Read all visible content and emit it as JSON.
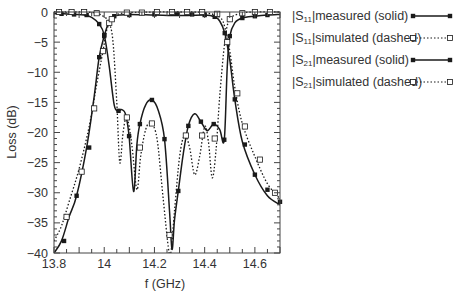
{
  "chart_data": {
    "type": "line",
    "title": "",
    "xlabel": "f (GHz)",
    "ylabel": "Loss (dB)",
    "xlim": [
      13.8,
      14.7
    ],
    "ylim": [
      -40,
      0
    ],
    "x_ticks": [
      13.8,
      14,
      14.2,
      14.4,
      14.6
    ],
    "x_tick_labels": [
      "13.8",
      "14",
      "14.2",
      "14.4",
      "14.6"
    ],
    "y_ticks": [
      0,
      -5,
      -10,
      -15,
      -20,
      -25,
      -30,
      -35,
      -40
    ],
    "y_tick_labels": [
      "0",
      "-5",
      "-10",
      "-15",
      "-20",
      "-25",
      "-30",
      "-35",
      "-40"
    ],
    "grid": false,
    "legend_position": "right, outside plot",
    "series": [
      {
        "name": "|S11|measured (solid)",
        "style": "solid",
        "marker": "filled-square",
        "x": [
          13.8,
          13.84,
          13.88,
          13.92,
          13.95,
          13.98,
          14.0,
          14.02,
          14.04,
          14.057,
          14.07,
          14.085,
          14.099,
          14.117,
          14.13,
          14.142,
          14.165,
          14.19,
          14.215,
          14.24,
          14.26,
          14.27,
          14.28,
          14.295,
          14.315,
          14.335,
          14.36,
          14.385,
          14.41,
          14.436,
          14.46,
          14.478,
          14.49,
          14.5,
          14.52,
          14.55,
          14.6,
          14.65,
          14.7
        ],
        "y": [
          -0.3,
          -0.3,
          -0.4,
          -0.5,
          -0.9,
          -2.0,
          -3.8,
          -9.0,
          -15.5,
          -16.4,
          -16.2,
          -17.0,
          -20.6,
          -29.8,
          -22.0,
          -18.6,
          -15.4,
          -14.6,
          -16.3,
          -21.1,
          -33.0,
          -39.4,
          -34.5,
          -29.7,
          -23.5,
          -18.9,
          -16.9,
          -18.2,
          -19.7,
          -18.6,
          -19.5,
          -21.2,
          -9.0,
          -4.0,
          -1.8,
          -1.0,
          -0.7,
          -0.5,
          -0.4
        ],
        "markers_x": [
          13.83,
          13.88,
          13.93,
          13.98,
          14.0,
          14.057,
          14.099,
          14.142,
          14.19,
          14.24,
          14.295,
          14.335,
          14.385,
          14.436,
          14.478,
          14.5,
          14.55,
          14.6,
          14.65
        ],
        "markers_y": [
          -0.3,
          -0.4,
          -0.5,
          -2.0,
          -3.8,
          -16.4,
          -20.6,
          -18.6,
          -14.6,
          -21.1,
          -29.7,
          -18.9,
          -18.2,
          -18.6,
          -21.2,
          -4.0,
          -1.0,
          -0.7,
          -0.5
        ]
      },
      {
        "name": "|S11|simulated (dashed)",
        "style": "dotted",
        "marker": "hollow-square",
        "x": [
          13.8,
          13.86,
          13.92,
          13.97,
          14.0,
          14.02,
          14.035,
          14.05,
          14.062,
          14.075,
          14.09,
          14.11,
          14.13,
          14.145,
          14.165,
          14.185,
          14.21,
          14.235,
          14.255,
          14.265,
          14.28,
          14.3,
          14.32,
          14.34,
          14.36,
          14.38,
          14.4,
          14.415,
          14.43,
          14.445,
          14.46,
          14.48,
          14.5,
          14.55,
          14.6,
          14.7
        ],
        "y": [
          0.0,
          0.0,
          0.0,
          -0.2,
          -0.8,
          -1.8,
          -5.0,
          -15.0,
          -25.0,
          -20.0,
          -17.5,
          -22.0,
          -29.5,
          -24.0,
          -19.5,
          -18.5,
          -21.0,
          -31.0,
          -39.0,
          -40.0,
          -33.0,
          -24.0,
          -20.5,
          -22.5,
          -27.0,
          -24.0,
          -19.0,
          -21.5,
          -27.5,
          -23.0,
          -14.0,
          -5.0,
          -1.2,
          -0.2,
          0.0,
          0.0
        ],
        "markers_x": [
          13.82,
          13.87,
          13.92,
          13.97,
          14.02,
          14.09,
          14.142,
          14.19,
          14.26,
          14.325,
          14.39,
          14.44,
          14.5,
          14.55,
          14.6,
          14.66
        ],
        "markers_y": [
          0.0,
          0.0,
          0.0,
          -0.2,
          -1.8,
          -17.5,
          -22.5,
          -18.5,
          -37.0,
          -20.5,
          -20.5,
          -21.0,
          -1.2,
          -0.2,
          0.0,
          0.0
        ]
      },
      {
        "name": "|S21|measured (solid)",
        "style": "solid",
        "marker": "filled-square",
        "x": [
          13.8,
          13.83,
          13.86,
          13.89,
          13.93,
          13.96,
          13.98,
          14.0,
          14.02,
          14.04,
          14.06,
          14.1,
          14.2,
          14.3,
          14.4,
          14.44,
          14.46,
          14.48,
          14.5,
          14.52,
          14.55,
          14.6,
          14.65,
          14.7
        ],
        "y": [
          -40.0,
          -38.0,
          -34.0,
          -30.5,
          -22.5,
          -14.0,
          -7.5,
          -4.0,
          -1.5,
          -0.7,
          -0.5,
          -0.4,
          -0.5,
          -0.6,
          -0.5,
          -0.8,
          -1.5,
          -3.5,
          -8.0,
          -14.5,
          -21.5,
          -27.0,
          -30.5,
          -32.0
        ],
        "markers_x": [
          13.84,
          13.89,
          13.94,
          13.98,
          14.0,
          14.04,
          14.1,
          14.2,
          14.29,
          14.35,
          14.4,
          14.44,
          14.48,
          14.52,
          14.56,
          14.6,
          14.65,
          14.7
        ],
        "markers_y": [
          -38.0,
          -30.5,
          -22.5,
          -7.5,
          -4.0,
          -0.7,
          -0.5,
          -0.4,
          -0.3,
          -0.4,
          -0.5,
          -0.8,
          -3.5,
          -14.5,
          -22.0,
          -27.0,
          -29.5,
          -31.5
        ]
      },
      {
        "name": "|S21|simulated (dashed)",
        "style": "dotted",
        "marker": "hollow-square",
        "x": [
          13.8,
          13.83,
          13.86,
          13.9,
          13.94,
          13.97,
          13.995,
          14.01,
          14.03,
          14.05,
          14.1,
          14.2,
          14.3,
          14.4,
          14.46,
          14.48,
          14.5,
          14.52,
          14.55,
          14.6,
          14.65,
          14.7
        ],
        "y": [
          -38.0,
          -35.5,
          -31.5,
          -26.0,
          -19.0,
          -12.0,
          -6.5,
          -3.0,
          -1.2,
          -0.4,
          -0.1,
          0.0,
          0.0,
          -0.1,
          -0.9,
          -2.5,
          -6.5,
          -12.5,
          -18.5,
          -24.0,
          -28.5,
          -31.0
        ],
        "markers_x": [
          13.85,
          13.91,
          13.96,
          13.995,
          14.03,
          14.09,
          14.15,
          14.21,
          14.27,
          14.33,
          14.39,
          14.45,
          14.49,
          14.53,
          14.56,
          14.62,
          14.68
        ],
        "markers_y": [
          -34.0,
          -26.5,
          -16.0,
          -6.5,
          -1.2,
          -0.1,
          -0.1,
          0.0,
          0.0,
          0.0,
          0.0,
          -0.3,
          -5.0,
          -13.5,
          -19.0,
          -24.5,
          -30.0
        ]
      }
    ]
  },
  "legend": {
    "items": [
      {
        "prefix": "|S",
        "sub": "11",
        "suffix": "|measured (solid)",
        "style": "solid",
        "marker": "filled"
      },
      {
        "prefix": "|S",
        "sub": "11",
        "suffix": "|simulated (dashed)",
        "style": "dotted",
        "marker": "hollow"
      },
      {
        "prefix": "|S",
        "sub": "21",
        "suffix": "|measured (solid)",
        "style": "solid",
        "marker": "filled"
      },
      {
        "prefix": "|S",
        "sub": "21",
        "suffix": "|simulated (dashed)",
        "style": "dotted",
        "marker": "hollow"
      }
    ]
  },
  "colors": {
    "line": "#1a1a1a",
    "axis": "#444444",
    "text": "#333333",
    "background": "#ffffff"
  }
}
